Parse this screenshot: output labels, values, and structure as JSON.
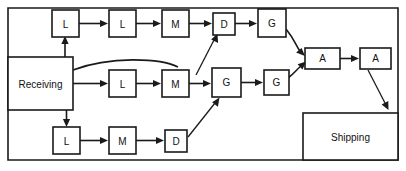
{
  "diagram": {
    "type": "flow-process-diagram",
    "title": "",
    "border_color": "#1a1a1a",
    "background_color": "#ffffff",
    "areas": [
      {
        "id": "receiving",
        "label": "Receiving",
        "x": 8,
        "y": 57,
        "w": 65,
        "h": 53
      },
      {
        "id": "shipping",
        "label": "Shipping",
        "x": 303,
        "y": 113,
        "w": 95,
        "h": 47
      }
    ],
    "nodes": [
      {
        "id": "n1",
        "label": "L",
        "x": 52,
        "y": 10,
        "w": 27,
        "h": 27,
        "row": "top"
      },
      {
        "id": "n2",
        "label": "L",
        "x": 109,
        "y": 10,
        "w": 27,
        "h": 27,
        "row": "top"
      },
      {
        "id": "n3",
        "label": "M",
        "x": 162,
        "y": 10,
        "w": 27,
        "h": 27,
        "row": "top"
      },
      {
        "id": "n4",
        "label": "D",
        "x": 213,
        "y": 13,
        "w": 22,
        "h": 22,
        "row": "top"
      },
      {
        "id": "n5",
        "label": "G",
        "x": 258,
        "y": 9,
        "w": 28,
        "h": 28,
        "row": "top"
      },
      {
        "id": "n6",
        "label": "L",
        "x": 109,
        "y": 70,
        "w": 27,
        "h": 27,
        "row": "middle"
      },
      {
        "id": "n7",
        "label": "M",
        "x": 162,
        "y": 70,
        "w": 27,
        "h": 27,
        "row": "middle"
      },
      {
        "id": "n8",
        "label": "G",
        "x": 212,
        "y": 68,
        "w": 29,
        "h": 29,
        "row": "middle"
      },
      {
        "id": "n9",
        "label": "G",
        "x": 264,
        "y": 70,
        "w": 25,
        "h": 25,
        "row": "middle"
      },
      {
        "id": "n10",
        "label": "A",
        "x": 305,
        "y": 48,
        "w": 35,
        "h": 21,
        "row": "assembly"
      },
      {
        "id": "n11",
        "label": "A",
        "x": 360,
        "y": 48,
        "w": 31,
        "h": 21,
        "row": "assembly"
      },
      {
        "id": "n12",
        "label": "L",
        "x": 53,
        "y": 127,
        "w": 27,
        "h": 27,
        "row": "bottom"
      },
      {
        "id": "n13",
        "label": "M",
        "x": 109,
        "y": 127,
        "w": 27,
        "h": 27,
        "row": "bottom"
      },
      {
        "id": "n14",
        "label": "D",
        "x": 165,
        "y": 130,
        "w": 22,
        "h": 22,
        "row": "bottom"
      }
    ],
    "edges": [
      {
        "from": "n1",
        "to": "n2",
        "style": "straight"
      },
      {
        "from": "n2",
        "to": "n3",
        "style": "straight"
      },
      {
        "from": "n3",
        "to": "n4",
        "style": "straight"
      },
      {
        "from": "n4",
        "to": "n5",
        "style": "straight"
      },
      {
        "from": "n5",
        "to": "n10",
        "style": "curve"
      },
      {
        "from": "receiving",
        "to": "n1",
        "style": "elbow-up"
      },
      {
        "from": "receiving",
        "to": "n6",
        "style": "straight"
      },
      {
        "from": "receiving",
        "to": "n7",
        "style": "curve-over"
      },
      {
        "from": "receiving",
        "to": "n12",
        "style": "elbow-down"
      },
      {
        "from": "n6",
        "to": "n7",
        "style": "straight"
      },
      {
        "from": "n7",
        "to": "n8",
        "style": "straight"
      },
      {
        "from": "n8",
        "to": "n9",
        "style": "straight"
      },
      {
        "from": "n8",
        "to": "n4",
        "style": "diagonal"
      },
      {
        "from": "n9",
        "to": "n10",
        "style": "curve"
      },
      {
        "from": "n12",
        "to": "n13",
        "style": "straight"
      },
      {
        "from": "n13",
        "to": "n14",
        "style": "straight"
      },
      {
        "from": "n14",
        "to": "n8",
        "style": "diagonal"
      },
      {
        "from": "n11",
        "to": "shipping",
        "style": "diagonal-down"
      }
    ]
  }
}
